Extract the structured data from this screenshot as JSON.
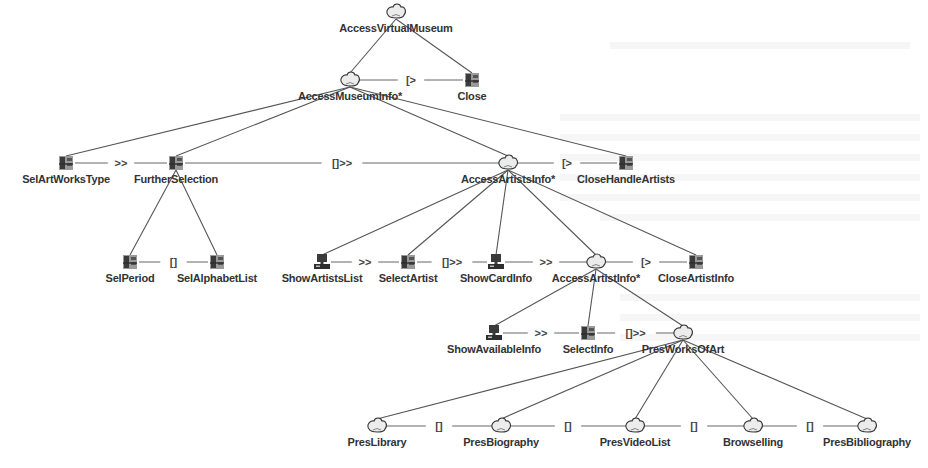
{
  "diagram": {
    "type": "ConcurTaskTrees task model",
    "colors": {
      "line": "#555555",
      "text": "#333333",
      "icon_dark": "#3a3a3a",
      "icon_mid": "#7a7a7a",
      "background": "#ffffff"
    },
    "task_types": {
      "abstract": "cloud-icon",
      "interaction": "user-interaction-icon",
      "application": "computer-icon"
    },
    "nodes": [
      {
        "id": "n0",
        "label": "AccessVirtualMuseum",
        "type": "abstract",
        "x": 396,
        "y": 12,
        "parent": null
      },
      {
        "id": "n1",
        "label": "AccessMuseumInfo*",
        "type": "abstract",
        "x": 350,
        "y": 80,
        "parent": "n0"
      },
      {
        "id": "n2",
        "label": "Close",
        "type": "interaction",
        "x": 472,
        "y": 80,
        "parent": "n0"
      },
      {
        "id": "n3",
        "label": "SelArtWorksType",
        "type": "interaction",
        "x": 66,
        "y": 163,
        "parent": "n1"
      },
      {
        "id": "n4",
        "label": "FurtherSelection",
        "type": "interaction",
        "x": 176,
        "y": 163,
        "parent": "n1"
      },
      {
        "id": "n5",
        "label": "AccessArtistsInfo*",
        "type": "abstract",
        "x": 508,
        "y": 163,
        "parent": "n1"
      },
      {
        "id": "n6",
        "label": "CloseHandleArtists",
        "type": "interaction",
        "x": 626,
        "y": 163,
        "parent": "n1"
      },
      {
        "id": "n7",
        "label": "SelPeriod",
        "type": "interaction",
        "x": 130,
        "y": 262,
        "parent": "n4"
      },
      {
        "id": "n8",
        "label": "SelAlphabetList",
        "type": "interaction",
        "x": 217,
        "y": 262,
        "parent": "n4"
      },
      {
        "id": "n9",
        "label": "ShowArtistsList",
        "type": "application",
        "x": 322,
        "y": 262,
        "parent": "n5"
      },
      {
        "id": "n10",
        "label": "SelectArtist",
        "type": "interaction",
        "x": 408,
        "y": 262,
        "parent": "n5"
      },
      {
        "id": "n11",
        "label": "ShowCardInfo",
        "type": "application",
        "x": 496,
        "y": 262,
        "parent": "n5"
      },
      {
        "id": "n12",
        "label": "AccessArtistInfo*",
        "type": "abstract",
        "x": 596,
        "y": 262,
        "parent": "n5"
      },
      {
        "id": "n13",
        "label": "CloseArtistInfo",
        "type": "interaction",
        "x": 696,
        "y": 262,
        "parent": "n5"
      },
      {
        "id": "n14",
        "label": "ShowAvailableInfo",
        "type": "application",
        "x": 494,
        "y": 333,
        "parent": "n12"
      },
      {
        "id": "n15",
        "label": "SelectInfo",
        "type": "interaction",
        "x": 588,
        "y": 333,
        "parent": "n12"
      },
      {
        "id": "n16",
        "label": "PresWorksOfArt",
        "type": "abstract",
        "x": 683,
        "y": 333,
        "parent": "n12"
      },
      {
        "id": "n17",
        "label": "PresLibrary",
        "type": "abstract",
        "x": 377,
        "y": 426,
        "parent": "n16"
      },
      {
        "id": "n18",
        "label": "PresBiography",
        "type": "abstract",
        "x": 501,
        "y": 426,
        "parent": "n16"
      },
      {
        "id": "n19",
        "label": "PresVideoList",
        "type": "abstract",
        "x": 635,
        "y": 426,
        "parent": "n16"
      },
      {
        "id": "n20",
        "label": "Browselling",
        "type": "abstract",
        "x": 753,
        "y": 426,
        "parent": "n16"
      },
      {
        "id": "n21",
        "label": "PresBibliography",
        "type": "abstract",
        "x": 867,
        "y": 426,
        "parent": "n16"
      }
    ],
    "operators": [
      {
        "from": "n1",
        "to": "n2",
        "symbol": "[>"
      },
      {
        "from": "n3",
        "to": "n4",
        "symbol": ">>"
      },
      {
        "from": "n4",
        "to": "n5",
        "symbol": "[]>>"
      },
      {
        "from": "n5",
        "to": "n6",
        "symbol": "[>"
      },
      {
        "from": "n7",
        "to": "n8",
        "symbol": "[]"
      },
      {
        "from": "n9",
        "to": "n10",
        "symbol": ">>"
      },
      {
        "from": "n10",
        "to": "n11",
        "symbol": "[]>>"
      },
      {
        "from": "n11",
        "to": "n12",
        "symbol": ">>"
      },
      {
        "from": "n12",
        "to": "n13",
        "symbol": "[>"
      },
      {
        "from": "n14",
        "to": "n15",
        "symbol": ">>"
      },
      {
        "from": "n15",
        "to": "n16",
        "symbol": "[]>>"
      },
      {
        "from": "n17",
        "to": "n18",
        "symbol": "[]"
      },
      {
        "from": "n18",
        "to": "n19",
        "symbol": "[]"
      },
      {
        "from": "n19",
        "to": "n20",
        "symbol": "[]"
      },
      {
        "from": "n20",
        "to": "n21",
        "symbol": "[]"
      }
    ]
  }
}
